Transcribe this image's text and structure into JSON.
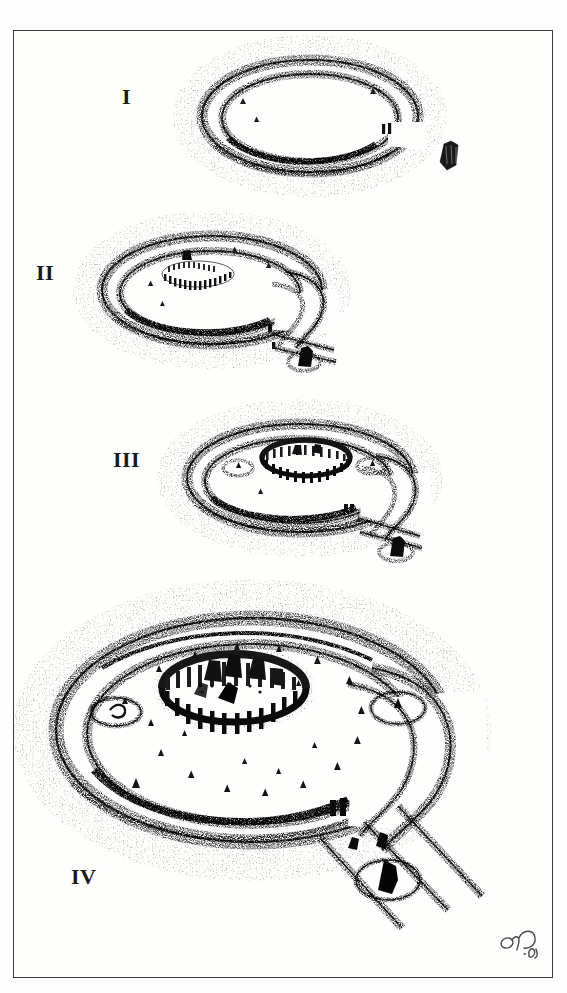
{
  "plate": {
    "title": "Stonehenge construction phases",
    "medium": "stipple / pen-and-ink archaeological reconstruction drawing",
    "background_color": "#fefefd",
    "ink_color": "#1a1a1a",
    "frame_color": "#3b3b3b",
    "width": 567,
    "height": 993
  },
  "figures": [
    {
      "label": "I",
      "name": "phase-one",
      "description": "Circular bank-and-ditch henge enclosure with a single north-east entrance causeway and an isolated standing stone set outside the entrance.",
      "features": [
        "outer bank",
        "inner ditch",
        "entrance causeway",
        "outlying standing stone",
        "inner portal stones"
      ]
    },
    {
      "label": "II",
      "name": "phase-two",
      "description": "Henge enclosure with a double arc of small bluestones set off-centre inside, entrance widened and the beginning of an avenue with flanking banks running out to the south-east.",
      "features": [
        "outer bank",
        "inner ditch",
        "bluestone double arc",
        "widened entrance",
        "avenue banks",
        "outlying stone in ring ditch",
        "entrance portal stones"
      ]
    },
    {
      "label": "III",
      "name": "phase-three",
      "description": "Completed lintelled sarsen circle at the centre of the enclosure, two station-stone mounds inside the bank, avenue running out to the south-east past the outlying stone.",
      "features": [
        "outer bank",
        "inner ditch",
        "lintelled sarsen circle",
        "station stone mounds",
        "paired portal stones",
        "avenue banks",
        "outlying stone in ring ditch"
      ]
    },
    {
      "label": "IV",
      "name": "phase-four",
      "description": "Final monument: full sarsen circle with trilithons and bluestone settings, ring of pits inside the bank, two station-stone barrows, double-banked avenue leading south-east to the outlying heel stone in its own ring ditch.",
      "features": [
        "outer bank",
        "inner ditch",
        "sarsen circle with lintels",
        "trilithon horseshoe",
        "ring of pits",
        "two station stone barrows",
        "paired portal stones",
        "double-banked avenue",
        "heel stone in ring ditch"
      ]
    }
  ],
  "signature": {
    "name": "artist-monogram",
    "year_mark": "'10",
    "description": "Small cursive artist monogram with a date mark at the lower right corner inside the frame."
  }
}
